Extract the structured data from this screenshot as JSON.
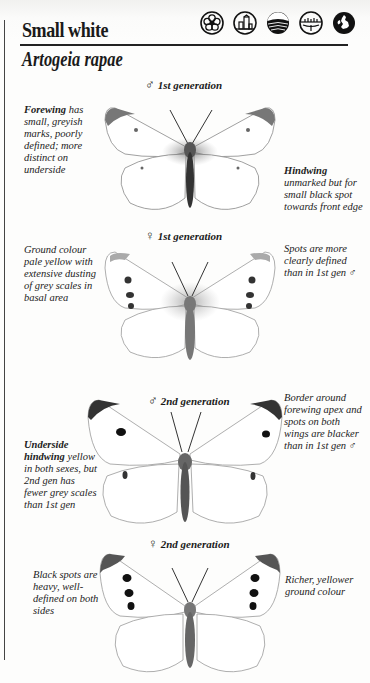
{
  "header": {
    "title": "Small white",
    "latin_name": "Artogeia rapae",
    "habitat_icons": [
      "garden-flower-icon",
      "urban-buildings-icon",
      "farmland-field-icon",
      "wetland-marsh-icon",
      "british-isles-map-icon"
    ]
  },
  "figures": [
    {
      "label": "1st generation",
      "sex_symbol": "♂",
      "spots": "faint"
    },
    {
      "label": "1st generation",
      "sex_symbol": "♀",
      "spots": "medium"
    },
    {
      "label": "2nd generation",
      "sex_symbol": "♂",
      "spots": "dark"
    },
    {
      "label": "2nd generation",
      "sex_symbol": "♀",
      "spots": "heavy"
    }
  ],
  "notes": {
    "forewing": {
      "bold": "Forewing",
      "text": " has small, greyish marks, poorly defined; more distinct on underside"
    },
    "hindwing": {
      "bold": "Hindwing",
      "text": " unmarked but for small black spot towards front edge"
    },
    "ground_colour": {
      "text": "Ground colour pale yellow with extensive dusting of grey scales in basal area"
    },
    "spots_defined": {
      "text": "Spots are more clearly defined than in 1st gen ♂"
    },
    "underside": {
      "bold": "Underside hindwing",
      "text": " yellow in both sexes, but 2nd gen has fewer grey scales than 1st gen"
    },
    "border": {
      "text": "Border around forewing apex and spots on both wings are blacker than in 1st gen ♂"
    },
    "black_spots": {
      "text": "Black spots are heavy, well-defined on both sides"
    },
    "richer": {
      "text": "Richer, yellower ground colour"
    }
  }
}
